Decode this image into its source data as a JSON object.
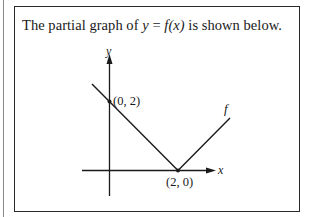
{
  "problem": {
    "prompt_before": "The partial graph of ",
    "prompt_math_y": "y",
    "prompt_math_eq": " = ",
    "prompt_math_f": "f",
    "prompt_math_arg": "(x)",
    "prompt_after": " is shown below."
  },
  "graph": {
    "x_axis_label": "x",
    "y_axis_label": "y",
    "curve_label": "f",
    "points": [
      {
        "label": "(0, 2)",
        "x": 0,
        "y": 2
      },
      {
        "label": "(2, 0)",
        "x": 2,
        "y": 0
      }
    ],
    "description": "V-shaped absolute-value-like graph: line from upper left through (0, 2) down to vertex (2, 0), then rising to the right",
    "colors": {
      "line": "#1a1a1a",
      "frame": "#2a2a2a"
    }
  }
}
